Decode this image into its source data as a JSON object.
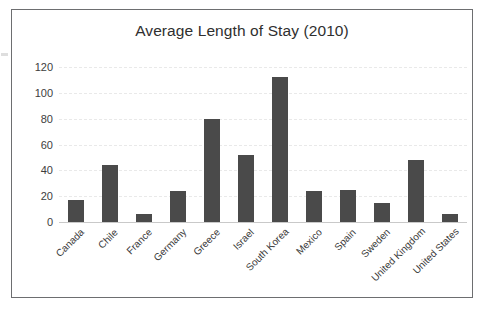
{
  "chart_data": {
    "type": "bar",
    "title": "Average Length of Stay (2010)",
    "xlabel": "",
    "ylabel": "",
    "categories": [
      "Canada",
      "Chile",
      "France",
      "Germany",
      "Greece",
      "Israel",
      "South Korea",
      "Mexico",
      "Spain",
      "Sweden",
      "United Kingdom",
      "United States"
    ],
    "values": [
      17,
      44,
      6,
      24,
      80,
      52,
      112,
      24,
      25,
      15,
      48,
      6
    ],
    "ylim": [
      0,
      120
    ],
    "yticks": [
      0,
      20,
      40,
      60,
      80,
      100,
      120
    ],
    "ytick_labels": [
      "0",
      "20",
      "40",
      "60",
      "80",
      "100",
      "120"
    ],
    "grid": true,
    "legend": false,
    "bar_color": "#4a4a4a",
    "gridline_color": "#e9e9e9",
    "border_color": "#6d6e70",
    "background": "#ffffff"
  }
}
